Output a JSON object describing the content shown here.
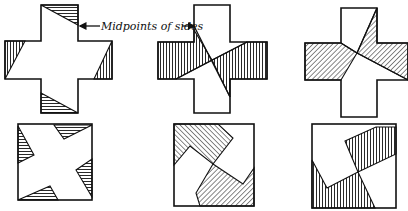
{
  "diagram": {
    "annotation": {
      "label": "Midpoints of sides"
    },
    "top_row": [
      {
        "id": "cross-1",
        "shape": "greek-cross",
        "hatching": "horizontal/vertical corner triangles"
      },
      {
        "id": "cross-2",
        "shape": "greek-cross",
        "hatching": "vertical, central pinwheel"
      },
      {
        "id": "cross-3",
        "shape": "greek-cross",
        "hatching": "diagonal, central pinwheel"
      }
    ],
    "bottom_row": [
      {
        "id": "square-1",
        "shape": "square",
        "hatching": "four corner triangles"
      },
      {
        "id": "square-2",
        "shape": "square",
        "hatching": "two diagonal-hatched regions"
      },
      {
        "id": "square-3",
        "shape": "square",
        "hatching": "vertical-hatched regions"
      }
    ],
    "colors": {
      "ink": "#111111",
      "paper": "#ffffff"
    }
  }
}
